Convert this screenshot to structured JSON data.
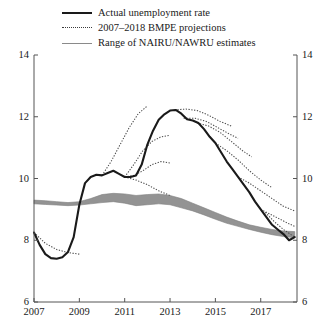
{
  "legend": {
    "items": [
      {
        "label": "Actual unemployment rate",
        "style": "solid-thick",
        "color": "#1a1a1a",
        "icon": "line-solid-thick-icon"
      },
      {
        "label": "2007–2018 BMPE projections",
        "style": "dotted",
        "color": "#3a3a3a",
        "icon": "line-dotted-icon"
      },
      {
        "label": "Range of NAIRU/NAWRU estimates",
        "style": "solid-thin",
        "color": "#8a8a8a",
        "icon": "line-solid-thin-icon"
      }
    ]
  },
  "chart_data": {
    "type": "line",
    "title": "",
    "xlabel": "",
    "ylabel": "",
    "xlim": [
      2007.0,
      2018.6
    ],
    "ylim": [
      6,
      14
    ],
    "yticks": [
      6,
      8,
      10,
      12,
      14
    ],
    "xticks": [
      2007,
      2009,
      2011,
      2013,
      2015,
      2017
    ],
    "ytick_labels_left": [
      "6",
      "8",
      "10",
      "12",
      "14"
    ],
    "ytick_labels_right": [
      "6",
      "8",
      "10",
      "12",
      "14"
    ],
    "xtick_labels": [
      "2007",
      "2009",
      "2011",
      "2013",
      "2015",
      "2017"
    ],
    "grid": false,
    "legend_position": "top",
    "series": [
      {
        "name": "Actual unemployment rate",
        "style": "solid-thick",
        "color": "#1a1a1a",
        "width": 2.1,
        "x": [
          2007.0,
          2007.25,
          2007.5,
          2007.75,
          2008.0,
          2008.25,
          2008.5,
          2008.75,
          2009.0,
          2009.25,
          2009.5,
          2009.75,
          2010.0,
          2010.25,
          2010.5,
          2010.75,
          2011.0,
          2011.25,
          2011.5,
          2011.75,
          2012.0,
          2012.25,
          2012.5,
          2012.75,
          2013.0,
          2013.25,
          2013.5,
          2013.75,
          2014.0,
          2014.25,
          2014.5,
          2014.75,
          2015.0,
          2015.25,
          2015.5,
          2015.75,
          2016.0,
          2016.25,
          2016.5,
          2016.75,
          2017.0,
          2017.25,
          2017.5,
          2017.75,
          2018.0,
          2018.25,
          2018.5
        ],
        "y": [
          8.25,
          7.85,
          7.55,
          7.42,
          7.4,
          7.45,
          7.62,
          8.1,
          9.15,
          9.85,
          10.05,
          10.12,
          10.1,
          10.18,
          10.25,
          10.15,
          10.05,
          10.05,
          10.1,
          10.45,
          11.1,
          11.55,
          11.9,
          12.08,
          12.2,
          12.22,
          12.1,
          11.92,
          11.88,
          11.8,
          11.6,
          11.35,
          11.15,
          10.85,
          10.55,
          10.3,
          10.05,
          9.8,
          9.55,
          9.25,
          9.0,
          8.75,
          8.5,
          8.35,
          8.2,
          8.0,
          8.1
        ]
      },
      {
        "name": "Projection 2007",
        "style": "dotted",
        "color": "#4a4a4a",
        "x": [
          2007.0,
          2007.5,
          2008.0,
          2008.5,
          2009.0
        ],
        "y": [
          8.25,
          7.9,
          7.7,
          7.6,
          7.55
        ]
      },
      {
        "name": "Projection 2010",
        "style": "dotted",
        "color": "#4a4a4a",
        "x": [
          2010.0,
          2010.4,
          2010.8,
          2011.2,
          2011.6,
          2012.0
        ],
        "y": [
          10.1,
          10.55,
          11.1,
          11.65,
          12.1,
          12.35
        ]
      },
      {
        "name": "Projection 2011a",
        "style": "dotted",
        "color": "#4a4a4a",
        "x": [
          2011.0,
          2011.4,
          2011.8,
          2012.2,
          2012.6,
          2013.0
        ],
        "y": [
          10.05,
          10.45,
          10.9,
          11.2,
          11.35,
          11.4
        ]
      },
      {
        "name": "Projection 2011b",
        "style": "dotted",
        "color": "#4a4a4a",
        "x": [
          2011.0,
          2011.4,
          2011.8,
          2012.2,
          2012.6,
          2013.0
        ],
        "y": [
          10.05,
          10.1,
          10.25,
          10.45,
          10.55,
          10.5
        ]
      },
      {
        "name": "Projection 2011c",
        "style": "dotted",
        "color": "#4a4a4a",
        "x": [
          2011.0,
          2011.5,
          2012.0,
          2012.5,
          2013.0
        ],
        "y": [
          10.05,
          9.95,
          9.8,
          9.6,
          9.45
        ]
      },
      {
        "name": "Projection 2013a",
        "style": "dotted",
        "color": "#4a4a4a",
        "x": [
          2013.2,
          2013.7,
          2014.2,
          2014.7,
          2015.2,
          2015.7
        ],
        "y": [
          12.22,
          12.25,
          12.2,
          12.05,
          11.85,
          11.7
        ]
      },
      {
        "name": "Projection 2013b",
        "style": "dotted",
        "color": "#4a4a4a",
        "x": [
          2013.6,
          2014.1,
          2014.6,
          2015.1,
          2015.6,
          2016.0
        ],
        "y": [
          11.95,
          11.95,
          11.85,
          11.65,
          11.45,
          11.3
        ]
      },
      {
        "name": "Projection 2014",
        "style": "dotted",
        "color": "#4a4a4a",
        "x": [
          2014.2,
          2014.7,
          2015.2,
          2015.7,
          2016.2,
          2016.6
        ],
        "y": [
          11.8,
          11.7,
          11.5,
          11.2,
          10.9,
          10.7
        ]
      },
      {
        "name": "Projection 2015",
        "style": "dotted",
        "color": "#4a4a4a",
        "x": [
          2015.0,
          2015.5,
          2016.0,
          2016.5,
          2017.0,
          2017.5
        ],
        "y": [
          11.15,
          10.9,
          10.6,
          10.25,
          9.95,
          9.7
        ]
      },
      {
        "name": "Projection 2016",
        "style": "dotted",
        "color": "#4a4a4a",
        "x": [
          2016.0,
          2016.5,
          2017.0,
          2017.5,
          2018.0,
          2018.5
        ],
        "y": [
          10.05,
          9.85,
          9.6,
          9.35,
          9.1,
          8.95
        ]
      },
      {
        "name": "Projection 2017",
        "style": "dotted",
        "color": "#4a4a4a",
        "x": [
          2017.0,
          2017.4,
          2017.8,
          2018.2,
          2018.5
        ],
        "y": [
          9.0,
          8.85,
          8.7,
          8.55,
          8.45
        ]
      },
      {
        "name": "Projection 2017b",
        "style": "dotted",
        "color": "#4a4a4a",
        "x": [
          2017.2,
          2017.6,
          2018.0,
          2018.4,
          2018.5
        ],
        "y": [
          8.9,
          8.6,
          8.35,
          8.15,
          8.1
        ]
      }
    ],
    "band": {
      "name": "Range of NAIRU/NAWRU estimates",
      "color": "#808080",
      "x": [
        2007.0,
        2007.5,
        2008.0,
        2008.5,
        2009.0,
        2009.5,
        2010.0,
        2010.5,
        2011.0,
        2011.5,
        2012.0,
        2012.5,
        2013.0,
        2013.5,
        2014.0,
        2014.5,
        2015.0,
        2015.5,
        2016.0,
        2016.5,
        2017.0,
        2017.5,
        2018.0,
        2018.5
      ],
      "upper": [
        9.3,
        9.28,
        9.25,
        9.22,
        9.25,
        9.35,
        9.48,
        9.52,
        9.5,
        9.45,
        9.48,
        9.5,
        9.45,
        9.35,
        9.2,
        9.05,
        8.9,
        8.75,
        8.62,
        8.5,
        8.42,
        8.35,
        8.3,
        8.28
      ],
      "lower": [
        9.18,
        9.16,
        9.14,
        9.12,
        9.14,
        9.18,
        9.22,
        9.25,
        9.2,
        9.12,
        9.15,
        9.18,
        9.15,
        9.05,
        8.95,
        8.82,
        8.68,
        8.55,
        8.45,
        8.35,
        8.26,
        8.18,
        8.12,
        8.08
      ]
    }
  }
}
